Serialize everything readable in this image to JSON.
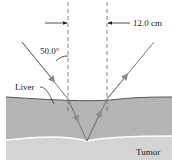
{
  "diagram": {
    "labels": {
      "angle": "50.0°",
      "width": "12.0 cm",
      "liver": "Liver",
      "tumor": "Tumor"
    },
    "colors": {
      "liver_fill": "#b5b5b5",
      "tumor_fill": "#d4d4d4",
      "surface_line": "#555555",
      "interface_line": "#ffffff",
      "ray": "#7a7a7a",
      "dashed": "#666666",
      "text": "#222222"
    }
  }
}
